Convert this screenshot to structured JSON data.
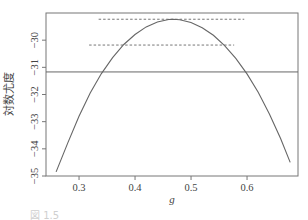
{
  "chart_data": {
    "type": "line",
    "title": "",
    "xlabel": "g",
    "ylabel": "対数尤度",
    "xlim": [
      0.241,
      0.691
    ],
    "ylim": [
      -35.0,
      -29.0
    ],
    "xticks": [
      0.3,
      0.4,
      0.5,
      0.6
    ],
    "xtick_labels": [
      "0.3",
      "0.4",
      "0.5",
      "0.6"
    ],
    "yticks": [
      -30,
      -31,
      -32,
      -33,
      -34,
      -35
    ],
    "ytick_labels": [
      "−30",
      "−31",
      "−32",
      "−33",
      "−34",
      "−35"
    ],
    "grid": false,
    "legend": null,
    "series": [
      {
        "name": "log-likelihood",
        "style": "solid",
        "x": [
          0.259,
          0.28,
          0.3,
          0.32,
          0.34,
          0.36,
          0.38,
          0.4,
          0.42,
          0.44,
          0.46,
          0.468,
          0.48,
          0.5,
          0.52,
          0.54,
          0.56,
          0.58,
          0.6,
          0.62,
          0.64,
          0.66,
          0.677
        ],
        "y": [
          -34.85,
          -33.78,
          -32.8,
          -31.95,
          -31.23,
          -30.64,
          -30.16,
          -29.79,
          -29.51,
          -29.33,
          -29.24,
          -29.23,
          -29.25,
          -29.35,
          -29.54,
          -29.82,
          -30.2,
          -30.67,
          -31.24,
          -31.92,
          -32.72,
          -33.62,
          -34.5
        ]
      }
    ],
    "reference_lines": [
      {
        "name": "horizontal-line",
        "style": "solid",
        "y": -31.17,
        "x_from": 0.241,
        "x_to": 0.691
      },
      {
        "name": "upper-dashed-line",
        "style": "dashed",
        "y": -29.23,
        "x_from": 0.335,
        "x_to": 0.595
      },
      {
        "name": "lower-dashed-line",
        "style": "dashed",
        "y": -30.18,
        "x_from": 0.318,
        "x_to": 0.577
      }
    ]
  },
  "caption": "図 1.5"
}
